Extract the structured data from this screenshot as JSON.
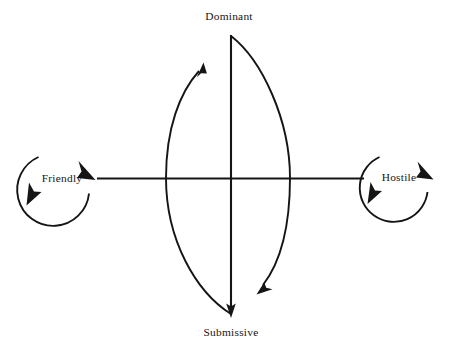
{
  "diagram": {
    "type": "interpersonal-circumplex",
    "background_color": "#ffffff",
    "line_color": "#151515",
    "poles": {
      "top": "Dominant",
      "bottom": "Submissive",
      "left": "Friendly",
      "right": "Hostile"
    },
    "nodes": [
      {
        "id": "friendly",
        "label": "Friendly",
        "side": "left"
      },
      {
        "id": "hostile",
        "label": "Hostile",
        "side": "right"
      }
    ],
    "axes": [
      {
        "id": "vertical-axis",
        "from": "Dominant",
        "to": "Submissive",
        "arrow_at": "bottom"
      },
      {
        "id": "horizontal-axis",
        "from": "Friendly",
        "to": "Hostile",
        "arrow_at": "both-ends"
      }
    ],
    "arcs": [
      {
        "id": "left-arc",
        "from": "Submissive",
        "to": "Dominant",
        "direction": "upward",
        "arrow_at": "top"
      },
      {
        "id": "right-arc",
        "from": "Dominant",
        "to": "Submissive",
        "direction": "downward",
        "arrow_at": "bottom"
      }
    ],
    "self-loops": [
      {
        "id": "friendly-loop",
        "label": "Friendly",
        "shape": "circular-arrow"
      },
      {
        "id": "hostile-loop",
        "label": "Hostile",
        "shape": "circular-arrow"
      }
    ]
  }
}
